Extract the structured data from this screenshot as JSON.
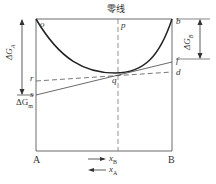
{
  "diagram": {
    "title": "零线",
    "points": {
      "o": "o",
      "p": "p",
      "b": "b",
      "f": "f",
      "d": "d",
      "q": "q",
      "r": "r",
      "s": "s"
    },
    "delta_ga": "ΔG",
    "delta_ga_sub": "A",
    "delta_gb": "ΔG",
    "delta_gb_sub": "B",
    "delta_gm": "ΔG",
    "delta_gm_sub": "m",
    "axis_left": "A",
    "axis_right": "B",
    "xb": "x",
    "xb_sub": "B",
    "xa": "x",
    "xa_sub": "A",
    "colors": {
      "line": "#333333",
      "curve": "#222222"
    }
  }
}
